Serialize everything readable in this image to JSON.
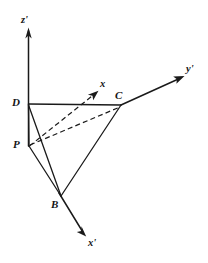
{
  "figure": {
    "type": "geometry-diagram",
    "background_color": "#ffffff",
    "line_color": "#1a1a1a"
  },
  "axes": [
    {
      "id": "z-prime",
      "label": "z'",
      "label_x": 21,
      "label_y": 15,
      "origin": {
        "x": 28.5,
        "y": 146
      },
      "tip": {
        "x": 28.5,
        "y": 29
      },
      "style": "solid"
    },
    {
      "id": "y-prime",
      "label": "y'",
      "label_x": 186,
      "label_y": 64,
      "origin": {
        "x": 121,
        "y": 105
      },
      "tip": {
        "x": 184,
        "y": 76
      },
      "style": "solid"
    },
    {
      "id": "x-prime",
      "label": "x'",
      "label_x": 88,
      "label_y": 238,
      "origin": {
        "x": 61,
        "y": 196
      },
      "tip": {
        "x": 86,
        "y": 236
      },
      "style": "solid"
    },
    {
      "id": "x",
      "label": "x",
      "label_x": 100,
      "label_y": 79,
      "origin": {
        "x": 29,
        "y": 146
      },
      "tip": {
        "x": 98,
        "y": 91
      },
      "style": "dashed"
    }
  ],
  "points": [
    {
      "id": "D",
      "label": "D",
      "x": 28.5,
      "y": 104,
      "label_x": 12,
      "label_y": 97
    },
    {
      "id": "P",
      "label": "P",
      "x": 29,
      "y": 146,
      "label_x": 13,
      "label_y": 139
    },
    {
      "id": "C",
      "label": "C",
      "x": 121,
      "y": 105,
      "label_x": 115,
      "label_y": 90
    },
    {
      "id": "B",
      "label": "B",
      "x": 61,
      "y": 196,
      "label_x": 51,
      "label_y": 199
    }
  ],
  "edges": [
    {
      "id": "D-C",
      "from": "D",
      "to": "C",
      "style": "solid"
    },
    {
      "id": "D-P",
      "from": "D",
      "to": "P",
      "style": "solid"
    },
    {
      "id": "D-B",
      "from": "D",
      "to": "B",
      "style": "solid"
    },
    {
      "id": "P-B",
      "from": "P",
      "to": "B",
      "style": "solid"
    },
    {
      "id": "B-C",
      "from": "B",
      "to": "C",
      "style": "solid"
    },
    {
      "id": "P-C",
      "from": "P",
      "to": "C",
      "style": "dashed"
    }
  ]
}
